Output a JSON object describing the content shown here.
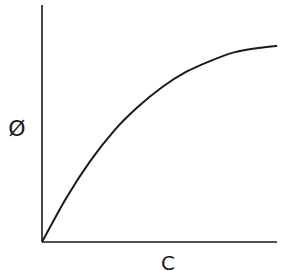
{
  "chart_data": {
    "type": "line",
    "title": "",
    "xlabel": "C",
    "ylabel": "Ø",
    "xlim": [
      0,
      1
    ],
    "ylim": [
      0,
      1
    ],
    "grid": false,
    "legend": null,
    "series": [
      {
        "name": "Ø vs C",
        "x": [
          0,
          0.1,
          0.2,
          0.3,
          0.4,
          0.5,
          0.6,
          0.7,
          0.8,
          0.9,
          0.98
        ],
        "y": [
          0,
          0.2,
          0.37,
          0.51,
          0.62,
          0.71,
          0.78,
          0.83,
          0.87,
          0.89,
          0.9
        ]
      }
    ]
  }
}
